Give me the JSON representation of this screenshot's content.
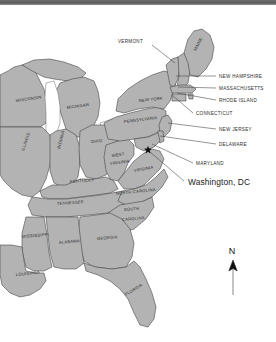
{
  "map": {
    "title": "Eastern United States reference map",
    "colors": {
      "land_fill": "#b3b3b3",
      "border_stroke": "#3a3a3a",
      "background": "#ffffff",
      "top_bar": "#5a5a5a",
      "marker": "#111111"
    },
    "inline_state_labels": [
      {
        "name": "WISCONSIN",
        "x": 16,
        "y": 97,
        "rotate": -8
      },
      {
        "name": "MICHIGAN",
        "x": 67,
        "y": 104,
        "rotate": -8
      },
      {
        "name": "ILLINOIS",
        "x": 24,
        "y": 146,
        "rotate": -72
      },
      {
        "name": "INDIANA",
        "x": 60,
        "y": 144,
        "rotate": -76
      },
      {
        "name": "OHIO",
        "x": 91,
        "y": 138,
        "rotate": -6
      },
      {
        "name": "NEW YORK",
        "x": 139,
        "y": 97,
        "rotate": -6
      },
      {
        "name": "PENNSYLVANIA",
        "x": 124,
        "y": 118,
        "rotate": -7
      },
      {
        "name": "WEST",
        "x": 112,
        "y": 152,
        "rotate": -8
      },
      {
        "name": "VIRGINIA",
        "x": 110,
        "y": 160,
        "rotate": -8
      },
      {
        "name": "VIRGINIA",
        "x": 134,
        "y": 167,
        "rotate": -10
      },
      {
        "name": "KENTUCKY",
        "x": 70,
        "y": 178,
        "rotate": -4
      },
      {
        "name": "TENNESSEE",
        "x": 57,
        "y": 200,
        "rotate": -4
      },
      {
        "name": "NORTH CAROLINA",
        "x": 116,
        "y": 190,
        "rotate": -6
      },
      {
        "name": "SOUTH",
        "x": 124,
        "y": 206,
        "rotate": -5
      },
      {
        "name": "CAROLINA",
        "x": 122,
        "y": 216,
        "rotate": -5
      },
      {
        "name": "MISSISSIPPI",
        "x": 22,
        "y": 233,
        "rotate": -5
      },
      {
        "name": "ALABAMA",
        "x": 59,
        "y": 239,
        "rotate": -5
      },
      {
        "name": "GEORGIA",
        "x": 97,
        "y": 235,
        "rotate": -5
      },
      {
        "name": "LOUISIANA",
        "x": 16,
        "y": 271,
        "rotate": -6
      },
      {
        "name": "FLORIDA",
        "x": 126,
        "y": 291,
        "rotate": -32
      },
      {
        "name": "MAINE",
        "x": 196,
        "y": 46,
        "rotate": -62
      }
    ],
    "callout_labels": [
      {
        "name": "VERMONT",
        "text_x": 118,
        "text_y": 38,
        "line": [
          152,
          40,
          175,
          58
        ]
      },
      {
        "name": "NEW HAMPSHIRE",
        "text_x": 219,
        "text_y": 73,
        "line": [
          176,
          71,
          216,
          71
        ]
      },
      {
        "name": "MASSACHUSETTS",
        "text_x": 219,
        "text_y": 85,
        "line": [
          178,
          82,
          216,
          83
        ]
      },
      {
        "name": "RHODE ISLAND",
        "text_x": 219,
        "text_y": 97,
        "line": [
          177,
          88,
          216,
          95
        ]
      },
      {
        "name": "CONNECTICUT",
        "text_x": 196,
        "text_y": 110,
        "line": [
          172,
          90,
          193,
          108
        ]
      },
      {
        "name": "NEW JERSEY",
        "text_x": 219,
        "text_y": 126,
        "line": [
          168,
          118,
          216,
          124
        ]
      },
      {
        "name": "DELAWARE",
        "text_x": 219,
        "text_y": 141,
        "line": [
          160,
          131,
          216,
          139
        ]
      },
      {
        "name": "MARYLAND",
        "text_x": 196,
        "text_y": 160,
        "line": [
          152,
          139,
          193,
          158
        ]
      }
    ],
    "city_marker": {
      "label": "Washington, DC",
      "label_x": 188,
      "label_y": 180,
      "star_x": 148,
      "star_y": 145,
      "line": [
        150,
        147,
        184,
        176
      ]
    },
    "compass": {
      "label": "N",
      "label_x": 232,
      "label_y": 249,
      "arrow_x": 233,
      "arrow_tip_y": 255,
      "arrow_base_y": 290
    }
  }
}
